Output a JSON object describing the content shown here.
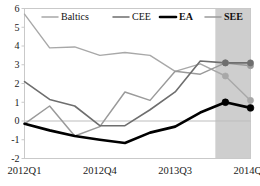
{
  "chart_data": {
    "type": "line",
    "title": "",
    "xlabel": "",
    "ylabel": "",
    "ylim": [
      -2,
      6
    ],
    "ytick_labels": [
      "6",
      "5",
      "4",
      "3",
      "2",
      "1",
      "0",
      "-1",
      "-2"
    ],
    "ytick_values": [
      6,
      5,
      4,
      3,
      2,
      1,
      0,
      -1,
      -2
    ],
    "grid": false,
    "zero_line": true,
    "legend_position": "top",
    "x": [
      "2012Q1",
      "2012Q2",
      "2012Q3",
      "2012Q4",
      "2013Q1",
      "2013Q2",
      "2013Q3",
      "2013Q4",
      "2014Q1",
      "2014Q2"
    ],
    "xtick_labels": [
      "2012Q1",
      "2012Q4",
      "2013Q3",
      "2014Q2"
    ],
    "xtick_indices": [
      0,
      3,
      6,
      9
    ],
    "forecast_shading": {
      "label": "shaded-forecast-region",
      "start_index": 7.6,
      "end_index": 9,
      "color": "#b0b0b0"
    },
    "series": [
      {
        "name": "Baltics",
        "color": "#a8a8a8",
        "width": 1.4,
        "values": [
          5.7,
          3.9,
          3.95,
          3.5,
          3.65,
          3.5,
          2.65,
          3.05,
          2.4,
          1.1
        ],
        "markers_from_index": 8,
        "marker_values": [
          2.4,
          1.1
        ]
      },
      {
        "name": "CEE",
        "color": "#6e6e6e",
        "width": 1.6,
        "values": [
          2.1,
          1.15,
          0.8,
          -0.25,
          -0.25,
          0.6,
          1.55,
          3.2,
          3.1,
          3.1
        ],
        "markers_from_index": 8,
        "marker_values": [
          3.1,
          3.1
        ]
      },
      {
        "name": "EA",
        "color": "#000000",
        "width": 2.6,
        "values": [
          -0.15,
          -0.5,
          -0.8,
          -1.0,
          -1.17,
          -0.62,
          -0.3,
          0.45,
          1.0,
          0.7
        ],
        "markers_from_index": 8,
        "marker_values": [
          1.0,
          0.7
        ]
      },
      {
        "name": "SEE",
        "color": "#9a9a9a",
        "width": 1.5,
        "values": [
          -0.15,
          0.8,
          -0.8,
          -0.3,
          1.55,
          1.1,
          2.65,
          2.5,
          3.1,
          2.95
        ],
        "markers_from_index": 8,
        "marker_values": [
          3.1,
          2.95
        ]
      }
    ]
  },
  "legend": {
    "entries": [
      {
        "label": "Baltics",
        "color": "#a8a8a8",
        "bold": false
      },
      {
        "label": "CEE",
        "color": "#6e6e6e",
        "bold": false
      },
      {
        "label": "EA",
        "color": "#000000",
        "bold": true
      },
      {
        "label": "SEE",
        "color": "#9a9a9a",
        "bold": true
      }
    ]
  },
  "axis": {
    "y_labels": [
      "6",
      "5",
      "4",
      "3",
      "2",
      "1",
      "0",
      "-1",
      "-2"
    ],
    "x_labels": [
      "2012Q1",
      "2012Q4",
      "2013Q3",
      "2014Q2"
    ]
  },
  "colors": {
    "frame": "#c9c9c9",
    "zero_line": "#bdbdbd",
    "shading": "#b0b0b0",
    "background": "#ffffff"
  }
}
